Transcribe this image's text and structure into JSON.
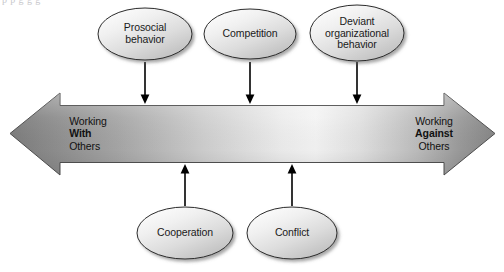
{
  "figure": {
    "top_cut_text": "p p                   g g g",
    "background_color": "#ffffff"
  },
  "axis": {
    "name": "working-with-against-continuum",
    "left": {
      "line1": "Working",
      "line2": "With",
      "line3": "Others"
    },
    "right": {
      "line1": "Working",
      "line2": "Against",
      "line3": "Others"
    },
    "gradient": {
      "end_color": "#7e7e7e",
      "mid_color": "#f2f2f2",
      "stroke_color": "#555555"
    }
  },
  "nodes": {
    "above": [
      {
        "id": "prosocial-behavior",
        "line1": "Prosocial",
        "line2": "behavior",
        "line3": ""
      },
      {
        "id": "competition",
        "line1": "Competition",
        "line2": "",
        "line3": ""
      },
      {
        "id": "deviant-organizational-behavior",
        "line1": "Deviant",
        "line2": "organizational",
        "line3": "behavior"
      }
    ],
    "below": [
      {
        "id": "cooperation",
        "line1": "Cooperation",
        "line2": "",
        "line3": ""
      },
      {
        "id": "conflict",
        "line1": "Conflict",
        "line2": "",
        "line3": ""
      }
    ]
  },
  "style": {
    "ellipse_fill_light": "#fbfbfb",
    "ellipse_fill_dark": "#c6c6c6",
    "ellipse_stroke": "#2b2b2b",
    "connector_color": "#000000"
  }
}
